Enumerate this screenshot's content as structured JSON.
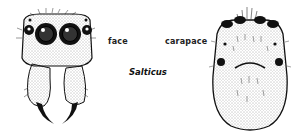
{
  "figure": {
    "title": "Salticus",
    "labels": {
      "face": "face",
      "carapace": "carapace"
    },
    "drawings": [
      {
        "name": "face",
        "description": "front view of jumping spider face with four anterior eyes and chelicerae with fangs"
      },
      {
        "name": "carapace",
        "description": "dorsal view of oval carapace with eyes along front edge"
      }
    ],
    "colors": {
      "ink": "#111111",
      "background": "#ffffff",
      "stipple": "#555555"
    }
  }
}
